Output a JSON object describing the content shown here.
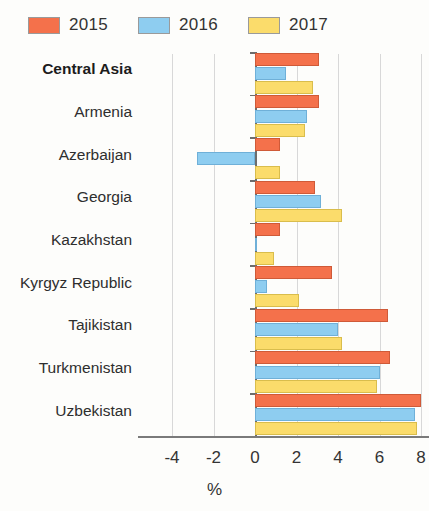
{
  "legend": {
    "items": [
      {
        "label": "2015",
        "color": "#f4714b"
      },
      {
        "label": "2016",
        "color": "#8ecdf0"
      },
      {
        "label": "2017",
        "color": "#fbdc6b"
      }
    ]
  },
  "axis": {
    "x_title": "%",
    "ticks": [
      "-4",
      "-2",
      "0",
      "2",
      "4",
      "6",
      "8"
    ]
  },
  "chart_data": {
    "type": "bar",
    "orientation": "horizontal",
    "title": "",
    "xlabel": "%",
    "ylabel": "",
    "xlim": [
      -4,
      8
    ],
    "xticks": [
      -4,
      -2,
      0,
      2,
      4,
      6,
      8
    ],
    "grid": true,
    "legend_position": "top-left",
    "categories": [
      "Central Asia",
      "Armenia",
      "Azerbaijan",
      "Georgia",
      "Kazakhstan",
      "Kyrgyz Republic",
      "Tajikistan",
      "Turkmenistan",
      "Uzbekistan"
    ],
    "emphasized_categories": [
      "Central Asia"
    ],
    "series": [
      {
        "name": "2015",
        "color": "#f4714b",
        "values": [
          3.1,
          3.1,
          1.2,
          2.9,
          1.2,
          3.7,
          6.4,
          6.5,
          8.0
        ]
      },
      {
        "name": "2016",
        "color": "#8ecdf0",
        "values": [
          1.5,
          2.5,
          -2.8,
          3.2,
          0.1,
          0.6,
          4.0,
          6.0,
          7.7
        ]
      },
      {
        "name": "2017",
        "color": "#fbdc6b",
        "values": [
          2.8,
          2.4,
          1.2,
          4.2,
          0.9,
          2.1,
          4.2,
          5.9,
          7.8
        ]
      }
    ]
  }
}
